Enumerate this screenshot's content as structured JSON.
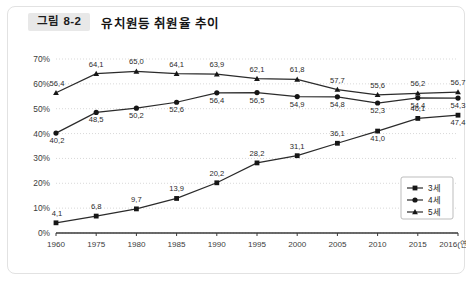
{
  "figure": {
    "badge": "그림 8-2",
    "title": "유치원등 취원율 추이"
  },
  "legend": {
    "items": [
      {
        "label": "3세",
        "marker": "square"
      },
      {
        "label": "4세",
        "marker": "circle"
      },
      {
        "label": "5세",
        "marker": "triangle"
      }
    ]
  },
  "axis": {
    "y_ticks": [
      "0%",
      "10%",
      "20%",
      "30%",
      "40%",
      "50%",
      "60%",
      "70%"
    ],
    "x_ticks": [
      "1960",
      "1975",
      "1980",
      "1985",
      "1990",
      "1995",
      "2000",
      "2005",
      "2010",
      "2015",
      "2016(연도)"
    ]
  },
  "chart_data": {
    "type": "line",
    "title": "유치원등 취원율 추이",
    "xlabel": "연도",
    "ylabel": "",
    "ylim": [
      0,
      70
    ],
    "grid": true,
    "legend_position": "bottom-right",
    "categories": [
      "1960",
      "1975",
      "1980",
      "1985",
      "1990",
      "1995",
      "2000",
      "2005",
      "2010",
      "2015",
      "2016(연도)"
    ],
    "series": [
      {
        "name": "3세",
        "marker": "square",
        "values": [
          4.1,
          6.8,
          9.7,
          13.9,
          20.2,
          28.2,
          31.1,
          36.1,
          41.0,
          46.1,
          47.4
        ]
      },
      {
        "name": "4세",
        "marker": "circle",
        "values": [
          40.2,
          48.5,
          50.2,
          52.6,
          56.4,
          56.5,
          54.9,
          54.8,
          52.3,
          54.4,
          54.3
        ]
      },
      {
        "name": "5세",
        "marker": "triangle",
        "values": [
          56.4,
          64.1,
          65.0,
          64.1,
          63.9,
          62.1,
          61.8,
          57.7,
          55.6,
          56.2,
          56.7
        ]
      }
    ]
  }
}
